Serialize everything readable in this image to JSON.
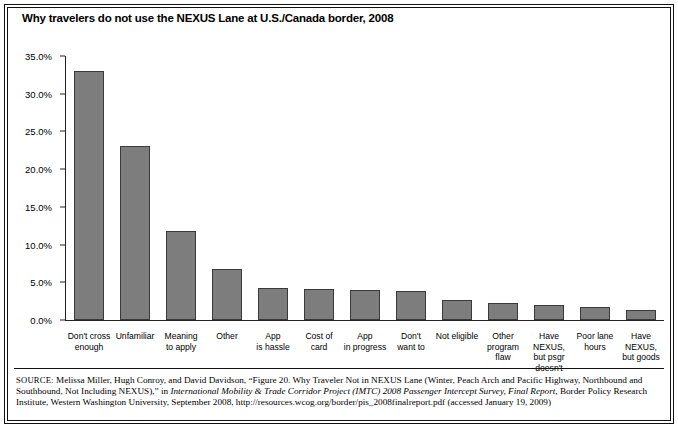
{
  "figure": {
    "title": "Why travelers do not use the NEXUS Lane at U.S./Canada border, 2008",
    "source_label": "SOURCE:",
    "source_part1": " Melissa Miller, Hugh Conroy, and David Davidson, “Figure 20. Why Traveler Not in NEXUS Lane (Winter, Peach Arch and Pacific Highway, Northbound and Southbound, Not Including NEXUS),” in ",
    "source_italic1": "International Mobility & Trade Corridor Project (IMTC) 2008 Passenger Intercept Survey, Final Report",
    "source_part2": ", Border Policy Research Institute, Western Washington University, September 2008, http://resources.wcog.org/border/pis_2008finalreport.pdf (accessed January 19, 2009)"
  },
  "chart_data": {
    "type": "bar",
    "title": "Why travelers do not use the NEXUS Lane at U.S./Canada border, 2008",
    "xlabel": "",
    "ylabel": "",
    "ylim": [
      0,
      35
    ],
    "ytick_labels": [
      "0.0%",
      "5.0%",
      "10.0%",
      "15.0%",
      "20.0%",
      "25.0%",
      "30.0%",
      "35.0%"
    ],
    "ytick_values": [
      0,
      5,
      10,
      15,
      20,
      25,
      30,
      35
    ],
    "grid": false,
    "legend": "none",
    "bar_color": "#7d7d7d",
    "bar_edge_color": "#3a3a3a",
    "categories": [
      "Don't cross enough",
      "Unfamiliar",
      "Meaning to apply",
      "Other",
      "App is hassle",
      "Cost of card",
      "App in progress",
      "Don't want to",
      "Not eligible",
      "Other program flaw",
      "Have NEXUS, but psgr doesn't",
      "Poor lane hours",
      "Have NEXUS, but goods"
    ],
    "category_lines": [
      [
        "Don't cross",
        "enough"
      ],
      [
        "Unfamiliar"
      ],
      [
        "Meaning",
        "to apply"
      ],
      [
        "Other"
      ],
      [
        "App",
        "is hassle"
      ],
      [
        "Cost of card"
      ],
      [
        "App",
        "in progress"
      ],
      [
        "Don't",
        "want to"
      ],
      [
        "Not eligible"
      ],
      [
        "Other",
        "program",
        "flaw"
      ],
      [
        "Have NEXUS,",
        "but psgr",
        "doesn't"
      ],
      [
        "Poor lane",
        "hours"
      ],
      [
        "Have NEXUS,",
        "but goods"
      ]
    ],
    "values": [
      33.0,
      23.1,
      11.8,
      6.8,
      4.2,
      4.1,
      4.0,
      3.9,
      2.7,
      2.2,
      2.0,
      1.7,
      1.3
    ]
  }
}
